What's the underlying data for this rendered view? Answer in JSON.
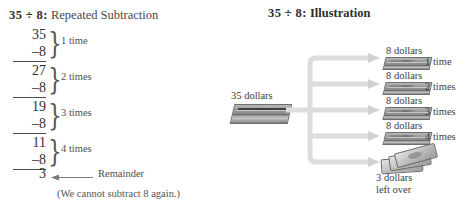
{
  "left_panel": {
    "heading": {
      "expression": "35 ÷ 8:",
      "subtitle": "Repeated Subtraction"
    },
    "steps": [
      {
        "minuend": "35",
        "subtrahend": "–8",
        "times_label": "1 time"
      },
      {
        "minuend": "27",
        "subtrahend": "–8",
        "times_label": "2 times"
      },
      {
        "minuend": "19",
        "subtrahend": "–8",
        "times_label": "3 times"
      },
      {
        "minuend": "11",
        "subtrahend": "–8",
        "times_label": "4 times"
      }
    ],
    "remainder": {
      "value": "3",
      "label": "Remainder"
    },
    "note": "(We cannot subtract 8 again.)"
  },
  "right_panel": {
    "heading": {
      "expression": "35 ÷ 8:",
      "subtitle": "Illustration"
    },
    "source": {
      "label": "35 dollars"
    },
    "branches": [
      {
        "money_label": "8 dollars",
        "times_label": "1 time"
      },
      {
        "money_label": "8 dollars",
        "times_label": "2 times"
      },
      {
        "money_label": "8 dollars",
        "times_label": "3 times"
      },
      {
        "money_label": "8 dollars",
        "times_label": "4 times"
      }
    ],
    "leftover": {
      "line1": "3 dollars",
      "line2": "left over"
    }
  },
  "colors": {
    "text": "#3a3a3a",
    "heading": "#2e2e2e",
    "connector": "#d9d9d9",
    "money_dark": "#8a8a8a",
    "rule": "#4a4a4a"
  }
}
